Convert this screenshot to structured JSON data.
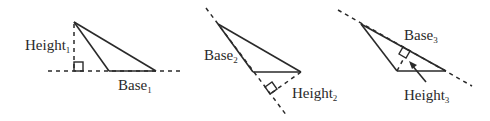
{
  "diagram": {
    "colors": {
      "stroke": "#2a2a2a",
      "background": "#ffffff"
    },
    "triangles": [
      {
        "id": "triangle-1",
        "height_label": "Height",
        "height_subscript": "1",
        "base_label": "Base",
        "base_subscript": "1",
        "note": "Height drawn outside triangle to extended base line"
      },
      {
        "id": "triangle-2",
        "height_label": "Height",
        "height_subscript": "2",
        "base_label": "Base",
        "base_subscript": "2",
        "note": "Base is slanted side; height dropped perpendicular to its extension"
      },
      {
        "id": "triangle-3",
        "height_label": "Height",
        "height_subscript": "3",
        "base_label": "Base",
        "base_subscript": "3",
        "note": "Base is long slanted side; height inside triangle indicated by arrow"
      }
    ]
  }
}
